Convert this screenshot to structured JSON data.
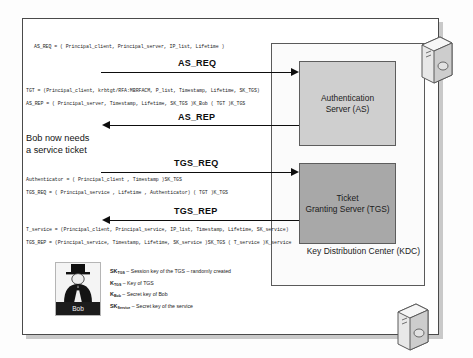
{
  "diagram": {
    "kdc_label": "Key Distribution Center (KDC)",
    "note": "Bob now needs\na service ticket",
    "note_line1": "Bob now needs",
    "note_line2": "a service ticket",
    "actor": {
      "name": "Bob",
      "icon": "person-tophat-avatar"
    },
    "nodes": [
      {
        "id": "as",
        "label_line1": "Authentication",
        "label_line2": "Server (AS)",
        "fill": "#cfcfcf"
      },
      {
        "id": "tgs",
        "label_line1": "Ticket",
        "label_line2": "Granting Server (TGS)",
        "fill": "#a8a8a8"
      }
    ],
    "messages": [
      {
        "id": "as_req",
        "label": "AS_REQ",
        "direction": "right"
      },
      {
        "id": "as_rep",
        "label": "AS_REP",
        "direction": "left"
      },
      {
        "id": "tgs_req",
        "label": "TGS_REQ",
        "direction": "right"
      },
      {
        "id": "tgs_rep",
        "label": "TGS_REP",
        "direction": "left"
      }
    ],
    "formulas": [
      {
        "id": "as_req_def",
        "text": "AS_REQ = ( Principal_client, Principal_server, IP_list, Lifetime )"
      },
      {
        "id": "tgt_def",
        "text": "TGT = (Principal_client, krbtgt/RFA:MBRFACM, P_list, Timestamp, Lifetime, SK_TGS)"
      },
      {
        "id": "as_rep_def",
        "text": "AS_REP = ( Principal_server, Timestamp, Lifetime, SK_TGS )K_Bob ( TGT )K_TGS"
      },
      {
        "id": "auth_def",
        "text": "Authenticator = ( Principal_client , Timestamp )SK_TGS"
      },
      {
        "id": "tgs_req_def",
        "text": "TGS_REQ = ( Principal_service , Lifetime , Authenticator) ( TGT )K_TGS"
      },
      {
        "id": "tsvc_def",
        "text": "T_service = (Principal_client, Principal_service, IP_list, Timestamp, Lifetime, SK_service)"
      },
      {
        "id": "tgs_rep_def",
        "text": "TGS_REP = (Principal_service, Timestamp, Lifetime, SK_service )SK_TGS ( T_service )K_service"
      }
    ],
    "legend": [
      {
        "symbol": "SK",
        "sub": "TGS",
        "text": "– Session key of the TGS – randomly created"
      },
      {
        "symbol": "K",
        "sub": "TGS",
        "text": "– Key of TGS"
      },
      {
        "symbol": "K",
        "sub": "Bob",
        "text": "– Secret key of Bob"
      },
      {
        "symbol": "SK",
        "sub": "Service",
        "text": "– Secret key of the service"
      }
    ],
    "icons": [
      {
        "id": "server-top",
        "name": "server-tower-icon"
      },
      {
        "id": "server-bottom",
        "name": "server-tower-icon"
      }
    ],
    "colors": {
      "as_fill": "#cfcfcf",
      "tgs_fill": "#a8a8a8",
      "stroke": "#0d0d0d",
      "frame": "#4a4a4a"
    }
  }
}
